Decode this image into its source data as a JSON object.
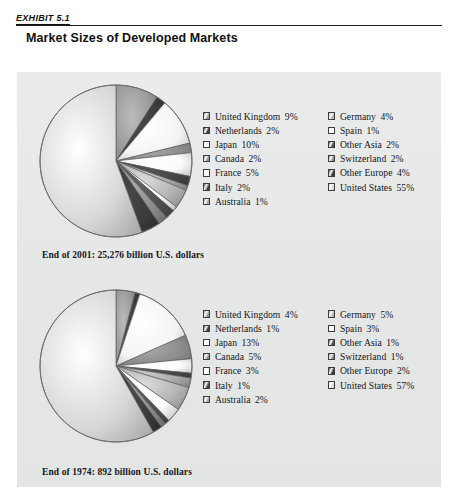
{
  "header": {
    "exhibit_label": "EXHIBIT 5.1",
    "title": "Market Sizes of Developed Markets"
  },
  "charts": [
    {
      "caption": "End of 2001: 25,276 billion U.S. dollars",
      "legend_left": [
        {
          "label": "United Kingdom",
          "pct": "9%"
        },
        {
          "label": "Netherlands",
          "pct": "2%"
        },
        {
          "label": "Japan",
          "pct": "10%"
        },
        {
          "label": "Canada",
          "pct": "2%"
        },
        {
          "label": "France",
          "pct": "5%"
        },
        {
          "label": "Italy",
          "pct": "2%"
        },
        {
          "label": "Australia",
          "pct": "1%"
        }
      ],
      "legend_right": [
        {
          "label": "Germany",
          "pct": "4%"
        },
        {
          "label": "Spain",
          "pct": "1%"
        },
        {
          "label": "Other Asia",
          "pct": "2%"
        },
        {
          "label": "Switzerland",
          "pct": "2%"
        },
        {
          "label": "Other Europe",
          "pct": "4%"
        },
        {
          "label": "United States",
          "pct": "55%"
        }
      ]
    },
    {
      "caption": "End of 1974: 892 billion U.S. dollars",
      "legend_left": [
        {
          "label": "United Kingdom",
          "pct": "4%"
        },
        {
          "label": "Netherlands",
          "pct": "1%"
        },
        {
          "label": "Japan",
          "pct": "13%"
        },
        {
          "label": "Canada",
          "pct": "5%"
        },
        {
          "label": "France",
          "pct": "3%"
        },
        {
          "label": "Italy",
          "pct": "1%"
        },
        {
          "label": "Australia",
          "pct": "2%"
        }
      ],
      "legend_right": [
        {
          "label": "Germany",
          "pct": "5%"
        },
        {
          "label": "Spain",
          "pct": "3%"
        },
        {
          "label": "Other Asia",
          "pct": "1%"
        },
        {
          "label": "Switzerland",
          "pct": "1%"
        },
        {
          "label": "Other Europe",
          "pct": "2%"
        },
        {
          "label": "United States",
          "pct": "57%"
        }
      ]
    }
  ],
  "chart_data": [
    {
      "type": "pie",
      "title": "End of 2001: 25,276 billion U.S. dollars",
      "unit": "percent of total market size",
      "total_label": "25,276 billion U.S. dollars",
      "legend_position": "right, two columns",
      "categories": [
        "United Kingdom",
        "Netherlands",
        "Japan",
        "Canada",
        "France",
        "Italy",
        "Australia",
        "Germany",
        "Spain",
        "Other Asia",
        "Switzerland",
        "Other Europe",
        "United States"
      ],
      "values": [
        9,
        2,
        10,
        2,
        5,
        2,
        1,
        4,
        1,
        2,
        2,
        4,
        55
      ],
      "colors": [
        "#9a9a9a",
        "#3d3d3d",
        "#f4f4f4",
        "#8d8d8d",
        "#fbfbfb",
        "#454545",
        "#a6a6a6",
        "#b4b4b4",
        "#fcfcfc",
        "#4f4f4f",
        "#8a8a8a",
        "#3a3a3a",
        "#d8d8d8"
      ]
    },
    {
      "type": "pie",
      "title": "End of 1974: 892 billion U.S. dollars",
      "unit": "percent of total market size",
      "total_label": "892 billion U.S. dollars",
      "legend_position": "right, two columns",
      "categories": [
        "United Kingdom",
        "Netherlands",
        "Japan",
        "Canada",
        "France",
        "Italy",
        "Australia",
        "Germany",
        "Spain",
        "Other Asia",
        "Switzerland",
        "Other Europe",
        "United States"
      ],
      "values": [
        4,
        1,
        13,
        5,
        3,
        1,
        2,
        5,
        3,
        1,
        1,
        2,
        57
      ],
      "colors": [
        "#9a9a9a",
        "#3d3d3d",
        "#f4f4f4",
        "#8d8d8d",
        "#fbfbfb",
        "#454545",
        "#a6a6a6",
        "#b4b4b4",
        "#fcfcfc",
        "#4f4f4f",
        "#8a8a8a",
        "#3a3a3a",
        "#d8d8d8"
      ]
    }
  ],
  "theme": {
    "panel_bg": "#e8e9e9",
    "page_bg": "#ffffff",
    "rule_color": "#1a1a1a",
    "text_color": "#14171a"
  }
}
